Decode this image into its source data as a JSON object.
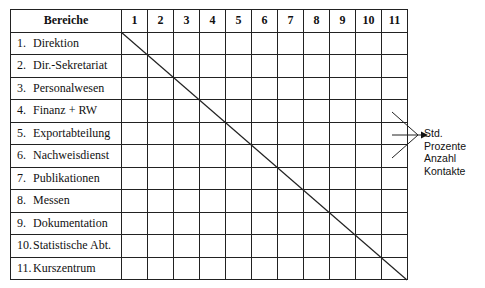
{
  "diagram": {
    "title_column_header": "Bereiche",
    "column_headers": [
      "1",
      "2",
      "3",
      "4",
      "5",
      "6",
      "7",
      "8",
      "9",
      "10",
      "11"
    ],
    "rows": [
      {
        "index": "1.",
        "label": "Direktion"
      },
      {
        "index": "2.",
        "label": "Dir.-Sekretariat"
      },
      {
        "index": "3.",
        "label": "Personalwesen"
      },
      {
        "index": "4.",
        "label": "Finanz + RW"
      },
      {
        "index": "5.",
        "label": "Exportabteilung"
      },
      {
        "index": "6.",
        "label": "Nachweisdienst"
      },
      {
        "index": "7.",
        "label": "Publikationen"
      },
      {
        "index": "8.",
        "label": "Messen"
      },
      {
        "index": "9.",
        "label": "Dokumentation"
      },
      {
        "index": "10.",
        "label": "Statistische Abt."
      },
      {
        "index": "11.",
        "label": "Kurszentrum"
      }
    ],
    "legend": [
      "Std.",
      "Prozente",
      "Anzahl",
      "Kontakte"
    ],
    "line_color": "#222222"
  }
}
